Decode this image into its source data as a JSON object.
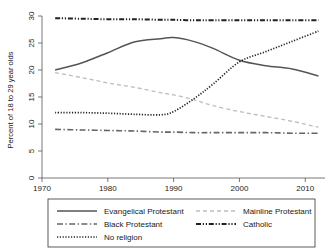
{
  "chart_data": {
    "type": "line",
    "title": "",
    "xlabel": "",
    "ylabel": "Percent of 18 to 29 year olds",
    "xlim": [
      1970,
      2013
    ],
    "ylim": [
      0,
      30
    ],
    "xticks": [
      "1970",
      "1980",
      "1990",
      "2000",
      "2010"
    ],
    "xtick_values": [
      1970,
      1980,
      1990,
      2000,
      2010
    ],
    "yticks": [
      "0",
      "5",
      "10",
      "15",
      "20",
      "25",
      "30"
    ],
    "ytick_values": [
      0,
      5,
      10,
      15,
      20,
      25,
      30
    ],
    "grid": false,
    "legend_position": "below-plot",
    "x": [
      1972,
      1976,
      1980,
      1984,
      1988,
      1990,
      1993,
      1996,
      2000,
      2004,
      2008,
      2012
    ],
    "series": [
      {
        "name": "Evangelical Protestant",
        "style": "solid",
        "color": "#555555",
        "width": 1.5,
        "values": [
          20.0,
          21.3,
          23.2,
          25.2,
          25.8,
          26.0,
          25.3,
          24.0,
          21.8,
          20.8,
          20.2,
          18.9
        ]
      },
      {
        "name": "Mainline Protestant",
        "style": "dashed",
        "color": "#bdbdbd",
        "width": 1.3,
        "values": [
          19.5,
          18.6,
          17.6,
          16.8,
          15.8,
          15.4,
          14.5,
          13.4,
          12.3,
          11.4,
          10.5,
          9.4
        ]
      },
      {
        "name": "Black Protestant",
        "style": "dashdot",
        "color": "#666666",
        "width": 1.6,
        "values": [
          9.0,
          8.9,
          8.8,
          8.7,
          8.5,
          8.5,
          8.4,
          8.4,
          8.4,
          8.4,
          8.3,
          8.3
        ]
      },
      {
        "name": "Catholic",
        "style": "dashdotdot",
        "color": "#222222",
        "width": 2.0,
        "values": [
          29.6,
          29.5,
          29.4,
          29.4,
          29.3,
          29.3,
          29.2,
          29.2,
          29.2,
          29.2,
          29.2,
          29.2
        ]
      },
      {
        "name": "No religion",
        "style": "dotted",
        "color": "#222222",
        "width": 1.7,
        "values": [
          12.1,
          12.1,
          12.0,
          11.8,
          11.7,
          12.3,
          14.6,
          17.4,
          21.5,
          23.4,
          25.3,
          27.2
        ]
      }
    ]
  },
  "legend": {
    "entries": [
      {
        "label": "Evangelical Protestant",
        "style": "solid"
      },
      {
        "label": "Mainline Protestant",
        "style": "dashed"
      },
      {
        "label": "Black Protestant",
        "style": "dashdot"
      },
      {
        "label": "Catholic",
        "style": "dashdotdot"
      },
      {
        "label": "No religion",
        "style": "dotted"
      }
    ]
  }
}
